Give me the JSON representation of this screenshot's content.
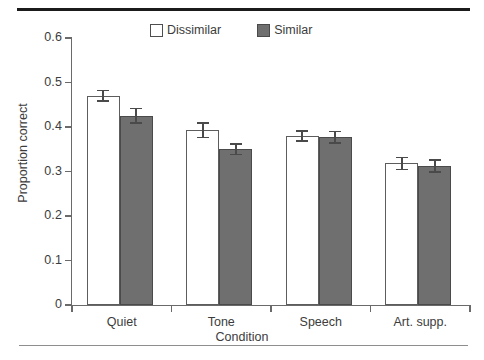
{
  "figure": {
    "top_rule": "thick-rule",
    "bottom_rule": "thin-rule"
  },
  "chart_data": {
    "type": "bar",
    "title": "",
    "xlabel": "Condition",
    "ylabel": "Proportion correct",
    "categories": [
      "Quiet",
      "Tone",
      "Speech",
      "Art. supp."
    ],
    "series": [
      {
        "name": "Dissimilar",
        "color": "#ffffff",
        "edge_color": "#5d5d5d",
        "values": [
          0.47,
          0.393,
          0.38,
          0.318
        ],
        "errors": [
          0.014,
          0.018,
          0.013,
          0.015
        ]
      },
      {
        "name": "Similar",
        "color": "#6f6f6f",
        "edge_color": "#4a4a4a",
        "values": [
          0.425,
          0.35,
          0.377,
          0.312
        ],
        "errors": [
          0.018,
          0.014,
          0.015,
          0.015
        ]
      }
    ],
    "ylim": [
      0,
      0.6
    ],
    "yticks": [
      0,
      0.1,
      0.2,
      0.3,
      0.4,
      0.5,
      0.6
    ],
    "ytick_labels": [
      "0",
      "0.1",
      "0.2",
      "0.3",
      "0.4",
      "0.5",
      "0.6"
    ],
    "grid": false,
    "legend_position": "top-center",
    "errorbar_type": "standard-error"
  },
  "legend": {
    "entries": [
      {
        "label": "Dissimilar",
        "swatch": "open-square-swatch"
      },
      {
        "label": "Similar",
        "swatch": "filled-square-swatch"
      }
    ]
  },
  "axes": {
    "y_title": "Proportion correct",
    "x_title": "Condition"
  }
}
